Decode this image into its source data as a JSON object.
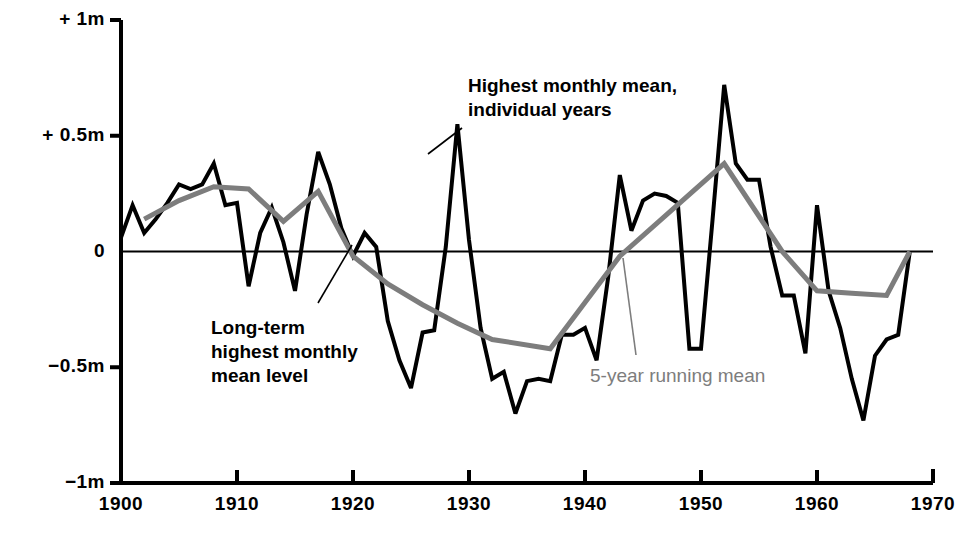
{
  "chart_data": {
    "type": "line",
    "title": "",
    "xlabel": "",
    "ylabel": "",
    "xlim": [
      1899,
      1970
    ],
    "ylim": [
      -1.0,
      1.0
    ],
    "grid": false,
    "legend_position": "inline-annotations",
    "x_ticks": [
      "1900",
      "1910",
      "1920",
      "1930",
      "1940",
      "1950",
      "1960",
      "1970"
    ],
    "x_tick_values": [
      1900,
      1910,
      1920,
      1930,
      1940,
      1950,
      1960,
      1970
    ],
    "y_ticks": [
      "+ 1m",
      "+ 0.5m",
      "0",
      "−0.5m",
      "−1m"
    ],
    "y_tick_values": [
      1.0,
      0.5,
      0.0,
      -0.5,
      -1.0
    ],
    "units": "m",
    "reference_line": {
      "value": 0,
      "label": "Long-term highest monthly mean level"
    },
    "series": [
      {
        "name": "Highest monthly mean, individual years",
        "color": "#000000",
        "width": 4,
        "x": [
          1900,
          1901,
          1902,
          1903,
          1904,
          1905,
          1906,
          1907,
          1908,
          1909,
          1910,
          1911,
          1912,
          1913,
          1914,
          1915,
          1916,
          1917,
          1918,
          1919,
          1920,
          1921,
          1922,
          1923,
          1924,
          1925,
          1926,
          1927,
          1928,
          1929,
          1930,
          1931,
          1932,
          1933,
          1934,
          1935,
          1936,
          1937,
          1938,
          1939,
          1940,
          1941,
          1942,
          1943,
          1944,
          1945,
          1946,
          1947,
          1948,
          1949,
          1950,
          1951,
          1952,
          1953,
          1954,
          1955,
          1956,
          1957,
          1958,
          1959,
          1960,
          1961,
          1962,
          1963,
          1964,
          1965,
          1966,
          1967,
          1968
        ],
        "y": [
          0.06,
          0.2,
          0.08,
          0.14,
          0.21,
          0.29,
          0.27,
          0.29,
          0.38,
          0.2,
          0.21,
          -0.15,
          0.08,
          0.19,
          0.04,
          -0.17,
          0.16,
          0.43,
          0.29,
          0.1,
          -0.02,
          0.08,
          0.02,
          -0.3,
          -0.47,
          -0.59,
          -0.35,
          -0.34,
          0.02,
          0.55,
          0.05,
          -0.33,
          -0.55,
          -0.52,
          -0.7,
          -0.56,
          -0.55,
          -0.56,
          -0.36,
          -0.36,
          -0.33,
          -0.47,
          -0.11,
          0.33,
          0.09,
          0.22,
          0.25,
          0.24,
          0.21,
          -0.42,
          -0.42,
          0.14,
          0.72,
          0.38,
          0.31,
          0.31,
          0.02,
          -0.19,
          -0.19,
          -0.44,
          0.2,
          -0.17,
          -0.33,
          -0.55,
          -0.73,
          -0.45,
          -0.38,
          -0.36,
          0.0
        ]
      },
      {
        "name": "5-year running mean",
        "color": "#7d7d7d",
        "width": 5,
        "x": [
          1902,
          1905,
          1908,
          1911,
          1914,
          1917,
          1920,
          1923,
          1926,
          1929,
          1932,
          1937,
          1940,
          1943,
          1952,
          1957,
          1960,
          1963,
          1966,
          1968
        ],
        "y": [
          0.14,
          0.22,
          0.28,
          0.27,
          0.13,
          0.26,
          -0.02,
          -0.14,
          -0.23,
          -0.31,
          -0.38,
          -0.42,
          -0.22,
          -0.02,
          0.38,
          0.0,
          -0.17,
          -0.18,
          -0.19,
          0.0
        ]
      }
    ],
    "annotations": [
      {
        "id": "annot-highest-monthly-mean",
        "text": "Highest monthly mean,\nindividual years",
        "color": "#000000",
        "text_x": 468,
        "text_y": 74,
        "leader": [
          [
            462,
            128
          ],
          [
            428,
            154
          ]
        ]
      },
      {
        "id": "annot-long-term-level",
        "text": "Long-term\nhighest monthly\nmean level",
        "color": "#000000",
        "text_x": 211,
        "text_y": 316,
        "leader": [
          [
            318,
            303
          ],
          [
            352,
            245
          ]
        ]
      },
      {
        "id": "annot-5yr-running-mean",
        "text": "5-year running mean",
        "color": "#7d7d7d",
        "text_x": 590,
        "text_y": 364,
        "leader": [
          [
            636,
            355
          ],
          [
            623,
            258
          ]
        ]
      }
    ]
  },
  "axes": {
    "y_labels": [
      {
        "text": "+ 1m",
        "value": 1.0
      },
      {
        "text": "+ 0.5m",
        "value": 0.5
      },
      {
        "text": "0",
        "value": 0.0
      },
      {
        "text": "−0.5m",
        "value": -0.5
      },
      {
        "text": "−1m",
        "value": -1.0
      }
    ],
    "x_labels": [
      {
        "text": "1900",
        "value": 1900
      },
      {
        "text": "1910",
        "value": 1910
      },
      {
        "text": "1920",
        "value": 1920
      },
      {
        "text": "1930",
        "value": 1930
      },
      {
        "text": "1940",
        "value": 1940
      },
      {
        "text": "1950",
        "value": 1950
      },
      {
        "text": "1960",
        "value": 1960
      },
      {
        "text": "1970",
        "value": 1970
      }
    ],
    "axis_color": "#000000"
  }
}
